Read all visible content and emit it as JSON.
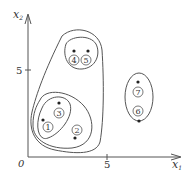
{
  "diagram": {
    "type": "hierarchical-clustering-scatter",
    "axes": {
      "x_label": "x",
      "x_sub": "1",
      "y_label": "x",
      "y_sub": "2",
      "origin_label": "0",
      "x_tick_label": "5",
      "y_tick_label": "5"
    },
    "points": [
      {
        "id": "1",
        "label": "1"
      },
      {
        "id": "2",
        "label": "2"
      },
      {
        "id": "3",
        "label": "3"
      },
      {
        "id": "4",
        "label": "4"
      },
      {
        "id": "5",
        "label": "5"
      },
      {
        "id": "6",
        "label": "6"
      },
      {
        "id": "7",
        "label": "7"
      }
    ],
    "clusters": [
      {
        "name": "cluster-1-3",
        "members": [
          "1",
          "3"
        ]
      },
      {
        "name": "cluster-1-2-3",
        "members": [
          "1",
          "2",
          "3"
        ]
      },
      {
        "name": "cluster-4-5",
        "members": [
          "4",
          "5"
        ]
      },
      {
        "name": "cluster-1-2-3-4-5",
        "members": [
          "1",
          "2",
          "3",
          "4",
          "5"
        ]
      },
      {
        "name": "cluster-6-7",
        "members": [
          "6",
          "7"
        ]
      }
    ],
    "colors": {
      "stroke": "#555555",
      "text": "#333333",
      "background": "#ffffff"
    }
  }
}
